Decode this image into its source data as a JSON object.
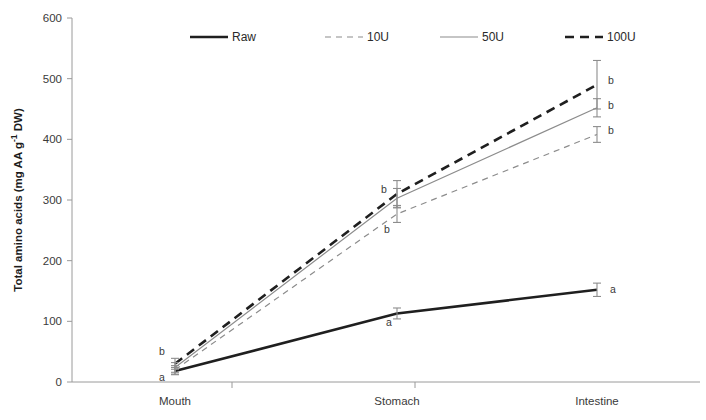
{
  "chart_data": {
    "type": "line",
    "title": "",
    "xlabel": "",
    "ylabel": "Total amino acids (mg AA g-1 DW)",
    "ylabel_parts": {
      "main": "Total amino acids (mg AA g",
      "sup": "-1",
      "tail": " DW)"
    },
    "categories": [
      "Mouth",
      "Stomach",
      "Intestine"
    ],
    "ylim": [
      0,
      600
    ],
    "yticks": [
      0,
      100,
      200,
      300,
      400,
      500,
      600
    ],
    "ytick_labels": [
      "0",
      "100",
      "200",
      "300",
      "400",
      "500",
      "600"
    ],
    "grid": false,
    "legend_position": "top-center",
    "series": [
      {
        "name": "Raw",
        "values": [
          18,
          113,
          152
        ],
        "errors": [
          6,
          9,
          11
        ],
        "style": "solid",
        "width": 2.6,
        "color": "#1f1f1f"
      },
      {
        "name": "10U",
        "values": [
          20,
          277,
          408
        ],
        "errors": [
          7,
          14,
          13
        ],
        "style": "dashed",
        "width": 1.2,
        "color": "#8c8c8c"
      },
      {
        "name": "50U",
        "values": [
          24,
          303,
          452
        ],
        "errors": [
          8,
          16,
          15
        ],
        "style": "solid",
        "width": 1.2,
        "color": "#8c8c8c"
      },
      {
        "name": "100U",
        "values": [
          30,
          310,
          490
        ],
        "errors": [
          9,
          22,
          40
        ],
        "style": "dashed",
        "width": 2.6,
        "color": "#1f1f1f"
      }
    ],
    "annotations": [
      {
        "text": "b",
        "category": "Mouth",
        "value": 45,
        "dx": -13,
        "dy": 0
      },
      {
        "text": "a",
        "category": "Mouth",
        "value": 2,
        "dx": -13,
        "dy": 0
      },
      {
        "text": "b",
        "category": "Stomach",
        "value": 312,
        "dx": -13,
        "dy": 0
      },
      {
        "text": "b",
        "category": "Stomach",
        "value": 245,
        "dx": -10,
        "dy": 0
      },
      {
        "text": "a",
        "category": "Stomach",
        "value": 92,
        "dx": -8,
        "dy": 0
      },
      {
        "text": "b",
        "category": "Intestine",
        "value": 492,
        "dx": 14,
        "dy": 0
      },
      {
        "text": "b",
        "category": "Intestine",
        "value": 450,
        "dx": 14,
        "dy": 0
      },
      {
        "text": "b",
        "category": "Intestine",
        "value": 408,
        "dx": 14,
        "dy": 0
      },
      {
        "text": "a",
        "category": "Intestine",
        "value": 146,
        "dx": 16,
        "dy": 0
      }
    ]
  },
  "colors": {
    "dark": "#1f1f1f",
    "gray": "#8c8c8c",
    "axis": "#9a9a9a",
    "text": "#3a3a3a",
    "background": "#ffffff"
  }
}
